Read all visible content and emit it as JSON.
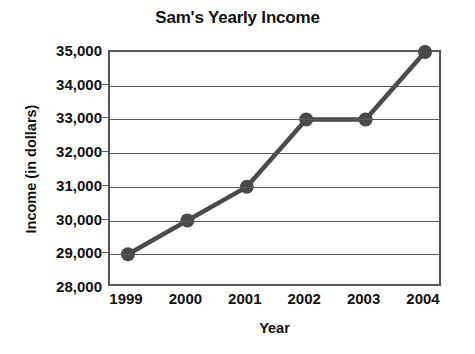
{
  "chart_data": {
    "type": "line",
    "title": "Sam's Yearly Income",
    "xlabel": "Year",
    "ylabel": "Income (in dollars)",
    "categories": [
      "1999",
      "2000",
      "2001",
      "2002",
      "2003",
      "2004"
    ],
    "values": [
      29000,
      30000,
      31000,
      33000,
      33000,
      35000
    ],
    "ytick_labels": [
      "35,000",
      "34,000",
      "33,000",
      "32,000",
      "31,000",
      "30,000",
      "29,000",
      "28,000"
    ],
    "ytick_values": [
      35000,
      34000,
      33000,
      32000,
      31000,
      30000,
      29000,
      28000
    ],
    "ylim": [
      28000,
      35000
    ],
    "grid": true,
    "legend": "none",
    "series_color": "#4a4a4a",
    "axis_color": "#555555",
    "marker": "circle"
  }
}
